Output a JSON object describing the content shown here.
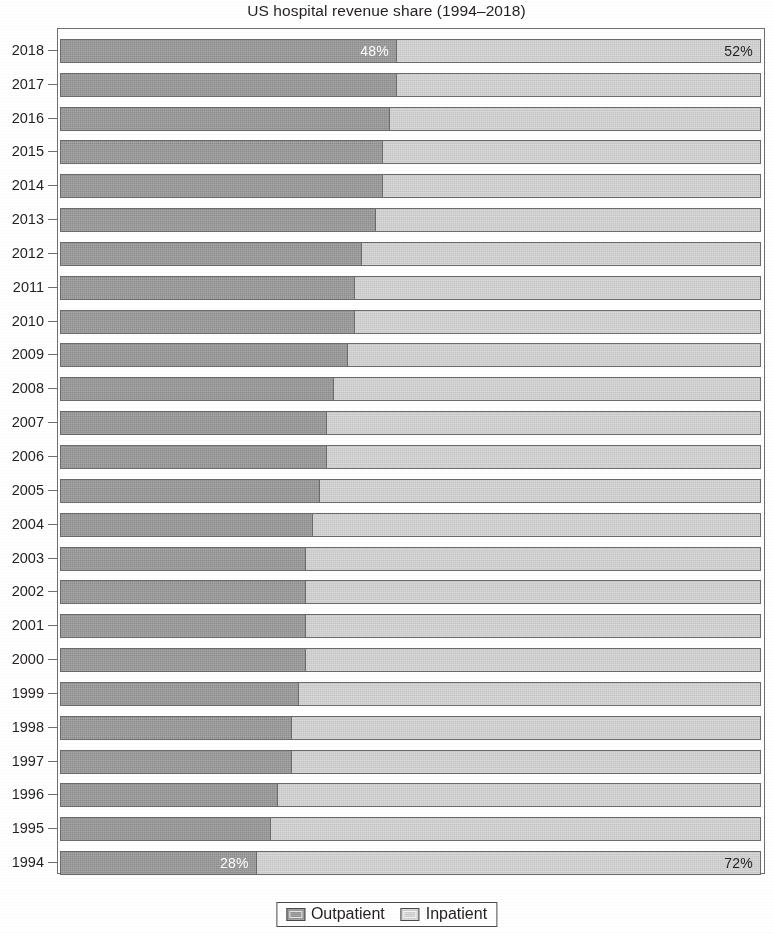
{
  "chart_data": {
    "type": "bar",
    "orientation": "horizontal",
    "stacked": true,
    "normalized": true,
    "title": "US hospital revenue share (1994–2018)",
    "xlabel": "",
    "ylabel": "",
    "xlim": [
      0,
      100
    ],
    "grid": false,
    "legend_position": "bottom-center",
    "categories": [
      "2018",
      "2017",
      "2016",
      "2015",
      "2014",
      "2013",
      "2012",
      "2011",
      "2010",
      "2009",
      "2008",
      "2007",
      "2006",
      "2005",
      "2004",
      "2003",
      "2002",
      "2001",
      "2000",
      "1999",
      "1998",
      "1997",
      "1996",
      "1995",
      "1994"
    ],
    "series": [
      {
        "name": "Outpatient",
        "color": "#9c9c9c",
        "values": [
          48,
          48,
          47,
          46,
          46,
          45,
          43,
          42,
          42,
          41,
          39,
          38,
          38,
          37,
          36,
          35,
          35,
          35,
          35,
          34,
          33,
          33,
          31,
          30,
          28
        ]
      },
      {
        "name": "Inpatient",
        "color": "#d5d5d5",
        "values": [
          52,
          52,
          53,
          54,
          54,
          55,
          57,
          58,
          58,
          59,
          61,
          62,
          62,
          63,
          64,
          65,
          65,
          65,
          65,
          66,
          67,
          67,
          69,
          70,
          72
        ]
      }
    ],
    "data_labels": [
      {
        "category": "2018",
        "series": "Outpatient",
        "text": "48%"
      },
      {
        "category": "2018",
        "series": "Inpatient",
        "text": "52%"
      },
      {
        "category": "1994",
        "series": "Outpatient",
        "text": "28%"
      },
      {
        "category": "1994",
        "series": "Inpatient",
        "text": "72%"
      }
    ]
  },
  "title": "US hospital revenue share (1994–2018)",
  "legend": {
    "items": [
      {
        "label": "Outpatient",
        "color": "#9c9c9c"
      },
      {
        "label": "Inpatient",
        "color": "#d5d5d5"
      }
    ]
  }
}
